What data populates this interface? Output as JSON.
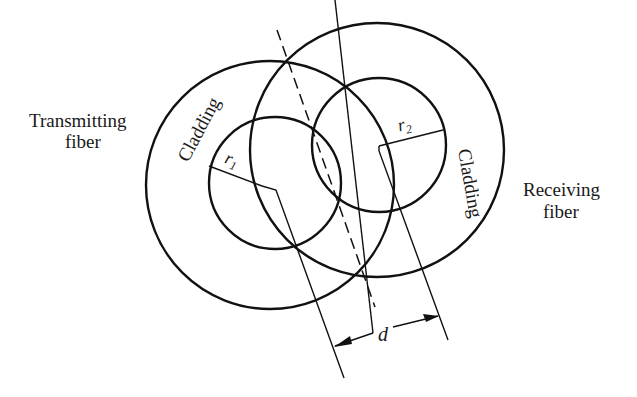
{
  "labels": {
    "transmitting_line1": "Transmitting",
    "transmitting_line2": "fiber",
    "receiving_line1": "Receiving",
    "receiving_line2": "fiber",
    "cladding_left": "Cladding",
    "cladding_right": "Cladding",
    "r1": "r",
    "r1_sub": "1",
    "r2": "r",
    "r2_sub": "2",
    "d": "d"
  },
  "colors": {
    "stroke": "#111111",
    "text": "#1a1a1a",
    "background": "#ffffff"
  }
}
